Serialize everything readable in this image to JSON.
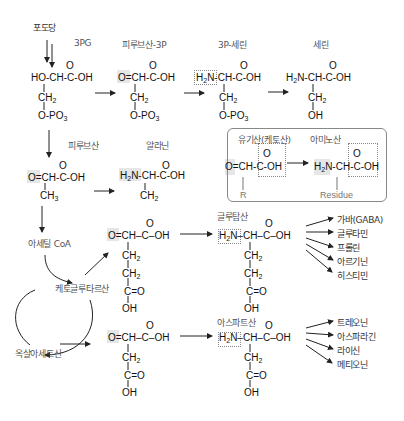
{
  "title_start": "포도당",
  "molecules": {
    "pg3": {
      "label": "3PG",
      "top": "O",
      "main": "HO-CH-C-OH",
      "chain": [
        "CH2",
        "O-PO3"
      ]
    },
    "pyruvate_3p": {
      "label": "피루브산-3P",
      "top": "O",
      "main": "O=CH-C-OH",
      "chain": [
        "CH2",
        "O-PO3"
      ]
    },
    "serine_3p": {
      "label": "3P-세린",
      "top": "O",
      "main": "H2N-CH-C-OH",
      "chain": [
        "CH2",
        "O-PO3"
      ]
    },
    "serine": {
      "label": "세린",
      "top": "O",
      "main": "H2N-CH-C-OH",
      "chain": [
        "CH2",
        "OH"
      ]
    },
    "pyruvate": {
      "label": "피루브산",
      "top": "O",
      "main": "O=CH-C-OH",
      "chain": [
        "CH3"
      ]
    },
    "alanine": {
      "label": "알라닌",
      "top": "O",
      "main": "H2N-CH-C-OH",
      "chain": [
        "CH2"
      ]
    },
    "acetyl_coa": {
      "label": "아세틸 CoA"
    },
    "ketoglutarate": {
      "label": "케토글루타르산",
      "top": "O",
      "main": "O=CH-C-OH",
      "chain": [
        "CH2",
        "CH2",
        "C=O",
        "OH"
      ]
    },
    "oxaloacetate": {
      "label": "옥살아세트산",
      "top": "O",
      "main": "O=CH-C-OH",
      "chain": [
        "CH2",
        "C=O",
        "OH"
      ]
    },
    "glutamate": {
      "label": "글루탐산",
      "top": "O",
      "main": "H2N-CH-C-OH",
      "chain": [
        "CH2",
        "CH2",
        "C=O",
        "OH"
      ]
    },
    "aspartate": {
      "label": "아스파트산",
      "top": "O",
      "main": "H2N-CH-C-OH",
      "chain": [
        "CH2",
        "C=O",
        "OH"
      ]
    }
  },
  "legend_panel": {
    "organic_acid_label": "유기산(케토산)",
    "amino_acid_label": "아미노산",
    "organic_acid_formula": "O=CH-C-OH",
    "amino_acid_formula": "H2N-CH-C-OH",
    "organic_acid_side": "R",
    "amino_acid_side": "Residue",
    "top": "O"
  },
  "glutamate_products": [
    "가바(GABA)",
    "글루타민",
    "프롤린",
    "아르기닌",
    "히스티민"
  ],
  "aspartate_products": [
    "트레오닌",
    "아스파라긴",
    "라이신",
    "메티오닌"
  ]
}
